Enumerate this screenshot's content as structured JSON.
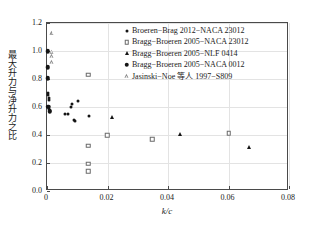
{
  "chart_data": {
    "type": "scatter",
    "title": "",
    "xlabel": "k/c",
    "ylabel": "最大升力与净升力之比",
    "xlim": [
      0,
      0.08
    ],
    "ylim": [
      0.0,
      1.2
    ],
    "xticks": [
      "0",
      "0.02",
      "0.04",
      "0.06",
      "0.08"
    ],
    "xtick_values": [
      0,
      0.02,
      0.04,
      0.06,
      0.08
    ],
    "yticks": [
      "0.0",
      "0.2",
      "0.4",
      "0.6",
      "0.8",
      "1.0",
      "1.2"
    ],
    "ytick_values": [
      0.0,
      0.2,
      0.4,
      0.6,
      0.8,
      1.0,
      1.2
    ],
    "grid": true,
    "legend_position": "top-right",
    "series": [
      {
        "name": "Broeren−Brag 2012−NACA 23012",
        "marker": "small-filled-dot",
        "color": "#151515",
        "points": [
          [
            0.0004,
            0.7
          ],
          [
            0.0004,
            0.683
          ],
          [
            0.0005,
            0.663
          ],
          [
            0.0005,
            0.648
          ],
          [
            0.0004,
            0.602
          ],
          [
            0.0006,
            0.585
          ],
          [
            0.001,
            0.575
          ],
          [
            0.006,
            0.553
          ],
          [
            0.007,
            0.551
          ],
          [
            0.0083,
            0.624
          ],
          [
            0.0078,
            0.6
          ],
          [
            0.009,
            0.507
          ],
          [
            0.0093,
            0.497
          ],
          [
            0.0103,
            0.643
          ],
          [
            0.0139,
            0.536
          ]
        ]
      },
      {
        "name": "Bragg−Broeren 2005−NACA 23012",
        "marker": "open-square",
        "color": "#6a6a6a",
        "points": [
          [
            0.0137,
            0.832
          ],
          [
            0.0137,
            0.322
          ],
          [
            0.0137,
            0.193
          ],
          [
            0.0137,
            0.142
          ],
          [
            0.0199,
            0.4
          ],
          [
            0.0348,
            0.37
          ],
          [
            0.06,
            0.411
          ]
        ]
      },
      {
        "name": "Bragg−Broeren 2005−NLF 0414",
        "marker": "filled-triangle",
        "color": "#151515",
        "points": [
          [
            0.0216,
            0.527
          ],
          [
            0.0439,
            0.407
          ],
          [
            0.0667,
            0.313
          ]
        ]
      },
      {
        "name": "Bragg−Broeren 2005−NACA 0012",
        "marker": "filled-circle",
        "color": "#151515",
        "points": [
          [
            0.0002,
            0.997
          ],
          [
            0.0002,
            0.884
          ],
          [
            0.0002,
            0.805
          ],
          [
            0.0004,
            0.601
          ],
          [
            0.0009,
            0.57
          ]
        ]
      },
      {
        "name": "Jasinski−Noe 等人 1997−S809",
        "marker": "open-triangle",
        "color": "#8a8a8a",
        "points": [
          [
            0.0018,
            1.13
          ],
          [
            0.0017,
            0.995
          ],
          [
            0.0017,
            0.963
          ],
          [
            0.0017,
            0.918
          ]
        ]
      }
    ]
  }
}
